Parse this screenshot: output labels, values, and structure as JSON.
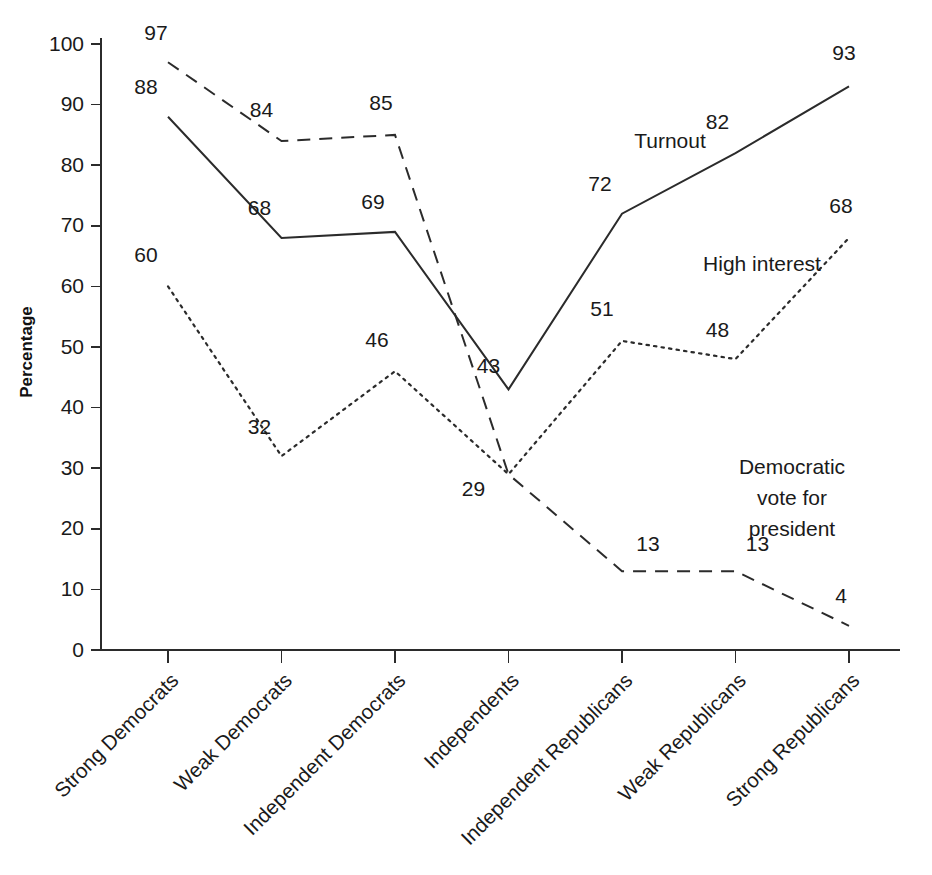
{
  "chart_data": {
    "type": "line",
    "title": "",
    "xlabel": "",
    "ylabel": "Percentage",
    "ylim": [
      0,
      100
    ],
    "ytick_step": 10,
    "grid": false,
    "legend_position": "inline-annotations",
    "categories": [
      "Strong Democrats",
      "Weak Democrats",
      "Independent Democrats",
      "Independents",
      "Independent Republicans",
      "Weak Republicans",
      "Strong Republicans"
    ],
    "ytick_labels": [
      "0",
      "10",
      "20",
      "30",
      "40",
      "50",
      "60",
      "70",
      "80",
      "90",
      "100"
    ],
    "series": [
      {
        "name": "Turnout",
        "style": "solid",
        "color": "#2b2b2b",
        "values": [
          88,
          68,
          69,
          43,
          72,
          82,
          93
        ],
        "label_offsets": [
          {
            "dx": -22,
            "dy": -28
          },
          {
            "dx": -22,
            "dy": -28
          },
          {
            "dx": -22,
            "dy": -28
          },
          {
            "dx": -20,
            "dy": -22
          },
          {
            "dx": -22,
            "dy": -28
          },
          {
            "dx": -18,
            "dy": -30
          },
          {
            "dx": -5,
            "dy": -32
          }
        ]
      },
      {
        "name": "Democratic vote for president",
        "style": "dashed",
        "color": "#2b2b2b",
        "values": [
          97,
          84,
          85,
          29,
          13,
          13,
          4
        ],
        "label_offsets": [
          {
            "dx": -12,
            "dy": -28
          },
          {
            "dx": -20,
            "dy": -30
          },
          {
            "dx": -14,
            "dy": -30
          },
          {
            "dx": -35,
            "dy": 16
          },
          {
            "dx": 26,
            "dy": -26
          },
          {
            "dx": 22,
            "dy": -26
          },
          {
            "dx": -8,
            "dy": -28
          }
        ]
      },
      {
        "name": "High interest",
        "style": "dotted",
        "color": "#2b2b2b",
        "values": [
          60,
          32,
          46,
          29,
          51,
          48,
          68
        ],
        "label_offsets": [
          {
            "dx": -22,
            "dy": -30
          },
          {
            "dx": -22,
            "dy": -28
          },
          {
            "dx": -18,
            "dy": -30
          },
          {
            "dx": 0,
            "dy": 0
          },
          {
            "dx": -20,
            "dy": -30
          },
          {
            "dx": -18,
            "dy": -28
          },
          {
            "dx": -8,
            "dy": -30
          }
        ]
      }
    ],
    "annotations": [
      {
        "text": "Turnout",
        "x": 670,
        "y": 142,
        "series": "Turnout"
      },
      {
        "text": "High interest",
        "x": 762,
        "y": 265,
        "series": "High interest"
      },
      {
        "text": "Democratic vote for president",
        "lines": [
          "Democratic",
          "vote for",
          "president"
        ],
        "x": 792,
        "y": 468,
        "series": "Democratic vote for president"
      }
    ]
  },
  "axis": {
    "y_title": "Percentage"
  }
}
